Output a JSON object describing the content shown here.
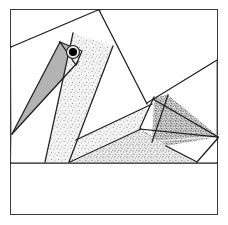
{
  "document": {
    "title": "Pelican Paper-Piecing Quilt Block",
    "subject": "stylized bird quilt block diagram",
    "width": 228,
    "height": 225,
    "background_color": "#ffffff"
  },
  "frame": {
    "label": "block-outer-border",
    "x": 10,
    "y": 9,
    "width": 208,
    "height": 206,
    "stroke_color": "#3a3a3a",
    "stroke_width": 1.4,
    "fill_color": "#ffffff"
  },
  "palette": {
    "outline": "#1d1d1d",
    "frame_stroke": "#3a3a3a",
    "background": "#ffffff",
    "beak_gray": "#b3b3b3",
    "speckle_light": "#efefef",
    "speckle_medium": "#e2e2e2",
    "speckle_dense": "#cfcfcf",
    "eye_black": "#000000",
    "white_patch": "#ffffff"
  },
  "textures": [
    {
      "name": "speckle-light",
      "description": "sparse fine dot speckle",
      "base": "#f4f4f4",
      "dot": "#9a9a9a",
      "density": "low"
    },
    {
      "name": "speckle-medium",
      "description": "medium fine dot speckle",
      "base": "#ececec",
      "dot": "#8f8f8f",
      "density": "medium"
    },
    {
      "name": "speckle-dense",
      "description": "dense crowded dot speckle",
      "base": "#e0e0e0",
      "dot": "#6f6f6f",
      "density": "high"
    }
  ],
  "patches": [
    {
      "id": "sky-upper-left",
      "label": "background-sky-upper-left",
      "fill": "white_patch",
      "texture": "none",
      "points": "11,10 11,47 73,33 95,27 98,10"
    },
    {
      "id": "sky-upper-right",
      "label": "background-sky-upper-right",
      "fill": "white_patch",
      "texture": "none",
      "points": "101,10 217,10 217,60 147,103 116,47"
    },
    {
      "id": "sky-left-mid",
      "label": "background-sky-left-middle",
      "fill": "white_patch",
      "texture": "none",
      "points": "11,48 72,34 56,62 12,133"
    },
    {
      "id": "sky-left-lower",
      "label": "background-sky-left-lower",
      "fill": "white_patch",
      "texture": "none",
      "points": "12,135 58,103 44,162 11,162"
    },
    {
      "id": "beak",
      "label": "bird-beak-gray-wedge",
      "fill": "beak_gray",
      "texture": "none",
      "points": "12,134 60,42 82,51 76,65"
    },
    {
      "id": "head-neck-band",
      "label": "bird-head-and-neck-band",
      "fill": "speckle_light",
      "texture": "speckle-light",
      "points": "73,33 113,46 69,162 45,162"
    },
    {
      "id": "neck-inner-sliver",
      "label": "neck-inner-sliver",
      "fill": "white_patch",
      "texture": "none",
      "points": "70,144 72,141 74,162 69,162"
    },
    {
      "id": "breast-white",
      "label": "bird-breast-white-wedge",
      "fill": "white_patch",
      "texture": "none",
      "points": "76,140 147,103 115,48"
    },
    {
      "id": "body-light",
      "label": "bird-body-light-speckle",
      "fill": "speckle_light",
      "texture": "speckle-light",
      "points": "70,141 152,105 139,129 68,162"
    },
    {
      "id": "wing-upper-dense",
      "label": "wing-upper-dense-speckle",
      "fill": "speckle_dense",
      "texture": "speckle-dense",
      "points": "154,97 168,95 218,136 152,141"
    },
    {
      "id": "wing-lower-dense",
      "label": "wing-lower-dense-speckle",
      "fill": "speckle_dense",
      "texture": "speckle-dense",
      "points": "140,128 152,142 217,137 166,146"
    },
    {
      "id": "tail-medium",
      "label": "tail-medium-speckle",
      "fill": "speckle_medium",
      "texture": "speckle-medium",
      "points": "73,162 140,130 167,147 196,162"
    },
    {
      "id": "tail-tip-white",
      "label": "tail-tip-white",
      "fill": "white_patch",
      "texture": "none",
      "points": "198,162 217,139 217,162"
    },
    {
      "id": "ground-band",
      "label": "bottom-empty-band",
      "fill": "white_patch",
      "texture": "none",
      "points": "11,163 217,163 217,214 11,214"
    }
  ],
  "seam_lines": [
    {
      "name": "seam-top-left-diagonal",
      "x1": 11,
      "y1": 47,
      "x2": 98,
      "y2": 10
    },
    {
      "name": "seam-neck-right-upper",
      "x1": 99,
      "y1": 10,
      "x2": 147,
      "y2": 104
    },
    {
      "name": "seam-neck-left-edge",
      "x1": 73,
      "y1": 33,
      "x2": 45,
      "y2": 162
    },
    {
      "name": "seam-neck-right-edge",
      "x1": 113,
      "y1": 46,
      "x2": 69,
      "y2": 162
    },
    {
      "name": "seam-beak-upper",
      "x1": 12,
      "y1": 134,
      "x2": 60,
      "y2": 42
    },
    {
      "name": "seam-beak-lower",
      "x1": 12,
      "y1": 134,
      "x2": 78,
      "y2": 62
    },
    {
      "name": "seam-breast-upper",
      "x1": 76,
      "y1": 140,
      "x2": 152,
      "y2": 104
    },
    {
      "name": "seam-body-lower",
      "x1": 70,
      "y1": 162,
      "x2": 141,
      "y2": 129
    },
    {
      "name": "seam-wing-upper-right",
      "x1": 153,
      "y1": 99,
      "x2": 218,
      "y2": 137
    },
    {
      "name": "seam-wing-vertical-left",
      "x1": 154,
      "y1": 97,
      "x2": 140,
      "y2": 128
    },
    {
      "name": "seam-wing-divide",
      "x1": 168,
      "y1": 95,
      "x2": 152,
      "y2": 142
    },
    {
      "name": "seam-wing-bottom",
      "x1": 140,
      "y1": 129,
      "x2": 218,
      "y2": 137
    },
    {
      "name": "seam-tail-edge",
      "x1": 166,
      "y1": 146,
      "x2": 197,
      "y2": 162
    },
    {
      "name": "seam-tail-tip",
      "x1": 218,
      "y1": 138,
      "x2": 197,
      "y2": 162
    },
    {
      "name": "seam-right-upper-slope",
      "x1": 147,
      "y1": 103,
      "x2": 217,
      "y2": 60
    },
    {
      "name": "seam-horizon",
      "x1": 11,
      "y1": 163,
      "x2": 217,
      "y2": 163
    }
  ],
  "eye": {
    "label": "bird-eye",
    "cx": 73,
    "cy": 52,
    "radius_outer": 6.5,
    "radius_inner": 4.0,
    "outer_fill": "#e8e8e8",
    "outer_stroke": "#1d1d1d",
    "inner_fill": "#000000"
  }
}
